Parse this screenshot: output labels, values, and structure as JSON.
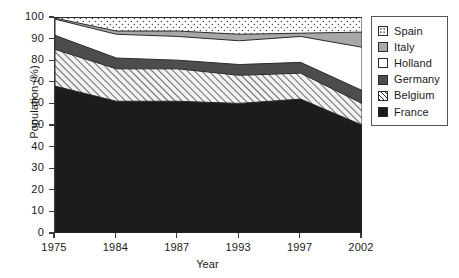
{
  "chart_data": {
    "type": "area",
    "stacked": true,
    "title": "",
    "xlabel": "Year",
    "ylabel": "Population (%)",
    "categories": [
      "1975",
      "1984",
      "1987",
      "1993",
      "1997",
      "2002"
    ],
    "x": [
      1975,
      1984,
      1987,
      1993,
      1997,
      2002
    ],
    "ylim": [
      0,
      100
    ],
    "yticks": [
      "0",
      "10",
      "20",
      "30",
      "40",
      "50",
      "60",
      "70",
      "80",
      "90",
      "100"
    ],
    "grid": false,
    "legend_position": "right",
    "series": [
      {
        "name": "France",
        "color": "#1c1c1c",
        "pattern": "solid-black",
        "values": [
          68,
          61,
          61,
          60,
          62,
          50
        ],
        "cumulative_top": [
          68,
          61,
          61,
          60,
          62,
          50
        ]
      },
      {
        "name": "Belgium",
        "color": "#ededed",
        "pattern": "diagonal-hatch",
        "values": [
          17,
          15,
          15,
          13,
          12,
          10
        ],
        "cumulative_top": [
          85,
          76,
          76,
          73,
          74,
          60
        ]
      },
      {
        "name": "Germany",
        "color": "#4d4d4d",
        "pattern": "solid-dark-gray",
        "values": [
          6.5,
          5,
          4,
          5,
          5,
          6
        ],
        "cumulative_top": [
          91.5,
          81,
          80,
          78,
          79,
          66
        ]
      },
      {
        "name": "Holland",
        "color": "#ffffff",
        "pattern": "solid-white",
        "values": [
          7.5,
          11,
          11,
          11,
          12,
          20
        ],
        "cumulative_top": [
          99,
          92,
          91,
          89,
          91,
          86
        ]
      },
      {
        "name": "Italy",
        "color": "#a8a8a8",
        "pattern": "solid-medium-gray",
        "values": [
          0.5,
          1.5,
          2.5,
          3,
          1.5,
          7
        ],
        "cumulative_top": [
          99.5,
          93.5,
          93.5,
          92,
          92.5,
          93
        ]
      },
      {
        "name": "Spain",
        "color": "#fbfbfb",
        "pattern": "stipple-dots",
        "values": [
          0.5,
          6.5,
          6.5,
          8,
          7.5,
          7
        ],
        "cumulative_top": [
          100,
          100,
          100,
          100,
          100,
          100
        ]
      }
    ],
    "legend": [
      {
        "label": "Spain",
        "pattern": "stipple-dots"
      },
      {
        "label": "Italy",
        "pattern": "solid-medium-gray"
      },
      {
        "label": "Holland",
        "pattern": "solid-white"
      },
      {
        "label": "Germany",
        "pattern": "solid-dark-gray"
      },
      {
        "label": "Belgium",
        "pattern": "diagonal-hatch"
      },
      {
        "label": "France",
        "pattern": "solid-black"
      }
    ]
  }
}
